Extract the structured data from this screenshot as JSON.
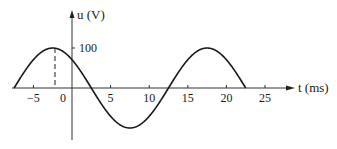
{
  "chart_data": {
    "type": "line",
    "title": "",
    "xlabel": "t (ms)",
    "ylabel": "u (V)",
    "x_ticks": [
      -5,
      0,
      5,
      10,
      15,
      20,
      25
    ],
    "x_tick_labels": [
      "-5",
      "0",
      "5",
      "10",
      "15",
      "20",
      "25"
    ],
    "y_ticks": [
      100
    ],
    "y_tick_labels": [
      "100"
    ],
    "xlim": [
      -9,
      30
    ],
    "ylim": [
      -115,
      190
    ],
    "grid": false,
    "legend": null,
    "series": [
      {
        "name": "u(t)",
        "function": "100*cos(2*pi*(t+2.5)/20)",
        "amplitude": 100,
        "period_ms": 20,
        "peak_t": -2.5,
        "t_range": [
          -7.5,
          22.5
        ],
        "x": [
          -7.5,
          -5,
          -2.5,
          0,
          2.5,
          5,
          7.5,
          10,
          12.5,
          15,
          17.5,
          20,
          22.5
        ],
        "values": [
          0,
          70.7,
          100,
          70.7,
          0,
          -70.7,
          -100,
          -70.7,
          0,
          70.7,
          100,
          70.7,
          0
        ]
      }
    ],
    "annotations": [
      {
        "type": "dashed-vertical-line",
        "x": -2.5,
        "from_y": 0,
        "to_y": 100,
        "note": "marks first peak"
      }
    ]
  },
  "labels": {
    "y_axis": "u (V)",
    "x_axis": "t (ms)",
    "y_tick_100": "100",
    "x_ticks": [
      "−5",
      "0",
      "5",
      "10",
      "15",
      "20",
      "25"
    ]
  },
  "colors": {
    "line": "#1a1a1a",
    "axis": "#333333",
    "background": "#ffffff"
  }
}
